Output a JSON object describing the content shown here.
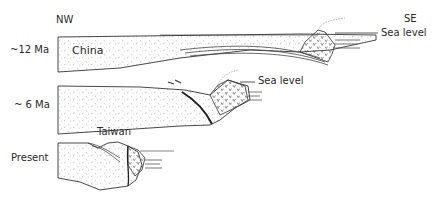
{
  "compass": {
    "left": "NW",
    "right": "SE"
  },
  "stages": [
    {
      "age": "~12 Ma",
      "block_label": "China",
      "sea_label": "Sea level"
    },
    {
      "age": "~ 6 Ma",
      "sea_label": "Sea level"
    },
    {
      "age": "Present",
      "block_label": "Taiwan"
    }
  ]
}
